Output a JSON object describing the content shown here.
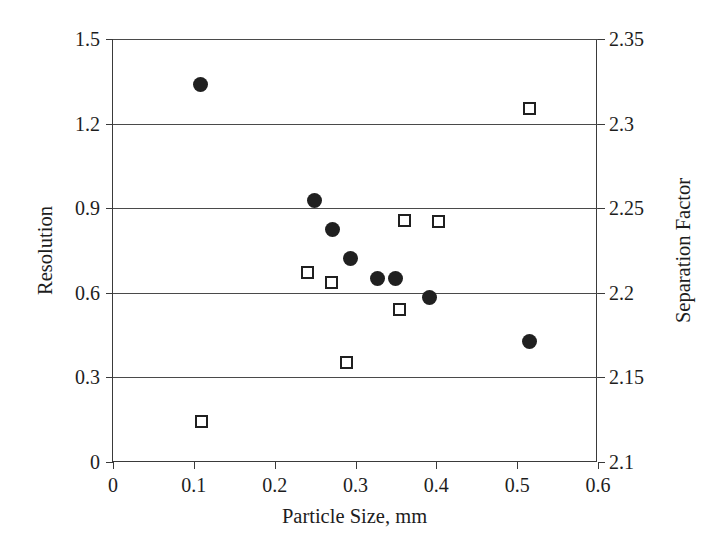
{
  "chart_data": {
    "type": "scatter",
    "title": "",
    "xlabel": "Particle Size, mm",
    "ylabel": "Resolution",
    "y2label": "Separation Factor",
    "xlim": [
      0,
      0.6
    ],
    "ylim": [
      0,
      1.5
    ],
    "y2lim": [
      2.1,
      2.35
    ],
    "xticks": [
      "0",
      "0.1",
      "0.2",
      "0.3",
      "0.4",
      "0.5",
      "0.6"
    ],
    "xtick_values": [
      0,
      0.1,
      0.2,
      0.3,
      0.4,
      0.5,
      0.6
    ],
    "yticks": [
      "0",
      "0.3",
      "0.6",
      "0.9",
      "1.2",
      "1.5"
    ],
    "ytick_values": [
      0,
      0.3,
      0.6,
      0.9,
      1.2,
      1.5
    ],
    "y2ticks": [
      "2.1",
      "2.15",
      "2.2",
      "2.25",
      "2.3",
      "2.35"
    ],
    "y2tick_values": [
      2.1,
      2.15,
      2.2,
      2.25,
      2.3,
      2.35
    ],
    "grid": true,
    "grid_axis": "y",
    "gridline_values": [
      0.3,
      0.6,
      0.9,
      1.2,
      1.5
    ],
    "legend": "none",
    "series": [
      {
        "name": "Resolution",
        "marker": "filled-circle",
        "axis": "left",
        "color": "#202020",
        "points": [
          {
            "x": 0.108,
            "y": 1.337
          },
          {
            "x": 0.249,
            "y": 0.929
          },
          {
            "x": 0.271,
            "y": 0.823
          },
          {
            "x": 0.294,
            "y": 0.72
          },
          {
            "x": 0.327,
            "y": 0.652
          },
          {
            "x": 0.349,
            "y": 0.652
          },
          {
            "x": 0.391,
            "y": 0.585
          },
          {
            "x": 0.515,
            "y": 0.429
          }
        ]
      },
      {
        "name": "Separation Factor",
        "marker": "open-square",
        "axis": "right",
        "color": "#202020",
        "points": [
          {
            "x": 0.11,
            "y": 2.124
          },
          {
            "x": 0.241,
            "y": 2.212
          },
          {
            "x": 0.27,
            "y": 2.206
          },
          {
            "x": 0.289,
            "y": 2.159
          },
          {
            "x": 0.354,
            "y": 2.19
          },
          {
            "x": 0.36,
            "y": 2.243
          },
          {
            "x": 0.403,
            "y": 2.242
          },
          {
            "x": 0.515,
            "y": 2.309
          }
        ]
      }
    ]
  }
}
